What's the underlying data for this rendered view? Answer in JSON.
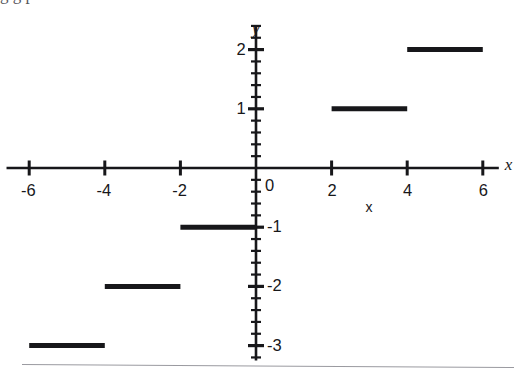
{
  "figure": {
    "background_color": "#ffffff",
    "ink_color": "#17171a",
    "width": 526,
    "height": 376,
    "top_bleed_text": "g      g  p",
    "page_rule": true
  },
  "chart_data": {
    "type": "line",
    "title": "",
    "subtitle": "",
    "xlabel": "x",
    "ylabel": "y",
    "xlim": [
      -6.6,
      6.9
    ],
    "ylim": [
      -3.25,
      2.45
    ],
    "grid": false,
    "legend": null,
    "x_axis": {
      "name": "x",
      "tick_labels": [
        "-6",
        "-4",
        "-2",
        "0",
        "2",
        "4",
        "6"
      ],
      "tick_values": [
        -6,
        -4,
        -2,
        0,
        2,
        4,
        6
      ],
      "minor_ticks_per_interval": 0,
      "axis_name_position": "right-end",
      "secondary_axis_name": "x",
      "secondary_axis_name_value": 3
    },
    "y_axis": {
      "name": "y",
      "tick_labels": [
        "2",
        "1",
        "-1",
        "-2",
        "-3"
      ],
      "tick_values": [
        2,
        1,
        -1,
        -2,
        -3
      ],
      "minor_ticks_per_interval": 4,
      "minor_tick_step": 0.2,
      "axis_name_position": "top-end"
    },
    "origin_label": "0",
    "series": [
      {
        "name": "step",
        "style": "horizontal-segments",
        "line_width": 5,
        "color": "#17171a",
        "segments": [
          {
            "x_start": -6,
            "x_end": -4,
            "y": -3
          },
          {
            "x_start": -4,
            "x_end": -2,
            "y": -2
          },
          {
            "x_start": -2,
            "x_end": 0,
            "y": -1
          },
          {
            "x_start": 2,
            "x_end": 4,
            "y": 1
          },
          {
            "x_start": 4,
            "x_end": 6,
            "y": 2
          }
        ]
      }
    ]
  }
}
